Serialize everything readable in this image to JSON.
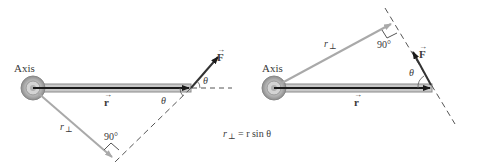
{
  "diagram": {
    "colors": {
      "rod_fill": "#c9c9c9",
      "rod_edge": "#8a8a8a",
      "arrow_dark": "#1a1a1a",
      "arrow_gray": "#a9a9a9",
      "dashed": "#555555",
      "text": "#3a3a3a"
    },
    "left": {
      "axis_label": "Axis",
      "r_label": "r",
      "f_label": "F",
      "theta_upper": "θ",
      "theta_lower": "θ",
      "rperp_label": "r",
      "rperp_sub": "⊥",
      "right_angle_label": "90°"
    },
    "right": {
      "axis_label": "Axis",
      "r_label": "r",
      "f_label": "F",
      "theta": "θ",
      "rperp_label": "r",
      "rperp_sub": "⊥",
      "right_angle_label": "90°"
    },
    "formula": {
      "lhs": "r",
      "lhs_sub": "⊥",
      "rhs": "= r sin θ"
    }
  }
}
